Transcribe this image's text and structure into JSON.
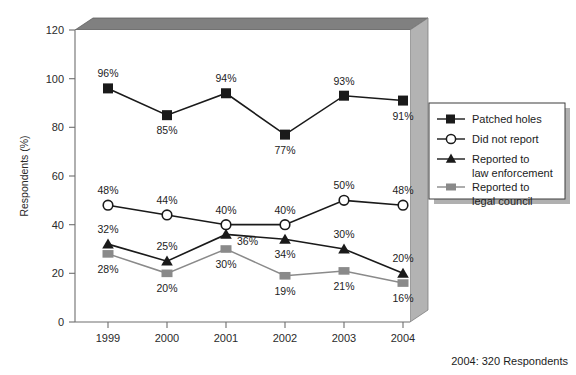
{
  "chart_data": {
    "type": "line",
    "title": "",
    "xlabel": "",
    "ylabel": "Respondents (%)",
    "categories": [
      "1999",
      "2000",
      "2001",
      "2002",
      "2003",
      "2004"
    ],
    "ylim": [
      0,
      120
    ],
    "yticks": [
      "0",
      "20",
      "40",
      "60",
      "80",
      "100",
      "120"
    ],
    "grid": false,
    "legend_position": "right",
    "series": [
      {
        "name": "Patched holes",
        "marker": "filled-square",
        "color": "#1a1a1a",
        "values": [
          96,
          85,
          94,
          77,
          93,
          91
        ],
        "labels": [
          "96%",
          "85%",
          "94%",
          "77%",
          "93%",
          "91%"
        ],
        "label_side": [
          "above",
          "below",
          "above",
          "below",
          "above",
          "below"
        ]
      },
      {
        "name": "Did not report",
        "marker": "open-circle",
        "color": "#1a1a1a",
        "values": [
          48,
          44,
          40,
          40,
          50,
          48
        ],
        "labels": [
          "48%",
          "44%",
          "40%",
          "40%",
          "50%",
          "48%"
        ],
        "label_side": [
          "above",
          "above",
          "above",
          "above",
          "above",
          "above"
        ]
      },
      {
        "name": "Reported to law enforcement",
        "marker": "filled-triangle",
        "color": "#1a1a1a",
        "values": [
          32,
          25,
          36,
          34,
          30,
          20
        ],
        "labels": [
          "32%",
          "25%",
          "36%",
          "34%",
          "30%",
          "20%"
        ],
        "label_side": [
          "above",
          "above",
          "right",
          "below",
          "above",
          "above"
        ]
      },
      {
        "name": "Reported to legal council",
        "marker": "filled-square-gray",
        "color": "#8a8a8a",
        "values": [
          28,
          20,
          30,
          19,
          21,
          16
        ],
        "labels": [
          "28%",
          "20%",
          "30%",
          "19%",
          "21%",
          "16%"
        ],
        "label_side": [
          "below",
          "below",
          "below",
          "below",
          "below",
          "below"
        ]
      }
    ],
    "annotations": [
      "2004: 320 Respondents"
    ]
  },
  "legend": {
    "entries": [
      {
        "label_line1": "Patched holes",
        "label_line2": ""
      },
      {
        "label_line1": "Did not report",
        "label_line2": ""
      },
      {
        "label_line1": "Reported to",
        "label_line2": "law enforcement"
      },
      {
        "label_line1": "Reported to",
        "label_line2": "legal council"
      }
    ]
  },
  "footer": {
    "note": "2004: 320 Respondents"
  },
  "colors": {
    "series_dark": "#1a1a1a",
    "series_gray": "#8a8a8a",
    "frame_top": "#808080",
    "frame_right": "#b3b3b3",
    "plot_bg": "#ffffff",
    "axis": "#6e6e6e"
  }
}
